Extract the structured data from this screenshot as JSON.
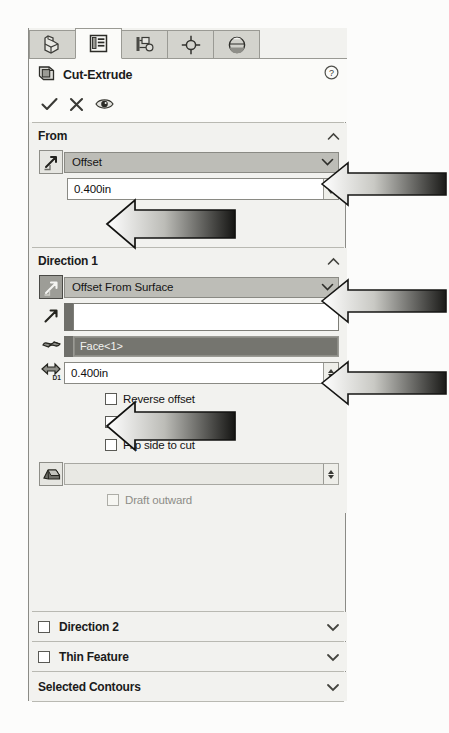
{
  "panel": {
    "title": "Cut-Extrude",
    "title_icon": "cut-extrude-icon",
    "help_icon": "help-circle-icon"
  },
  "tabs": [
    {
      "name": "feature-manager-tab",
      "icon": "solid-part-icon",
      "active": false
    },
    {
      "name": "property-manager-tab",
      "icon": "property-list-icon",
      "active": true
    },
    {
      "name": "configuration-manager-tab",
      "icon": "configuration-icon",
      "active": false
    },
    {
      "name": "dimxpert-manager-tab",
      "icon": "crosshair-target-icon",
      "active": false
    },
    {
      "name": "display-manager-tab",
      "icon": "appearance-sphere-icon",
      "active": false
    }
  ],
  "commands": [
    {
      "name": "ok-button",
      "icon": "checkmark-icon",
      "label": "OK"
    },
    {
      "name": "cancel-button",
      "icon": "x-cross-icon",
      "label": "Cancel"
    },
    {
      "name": "preview-button",
      "icon": "eye-icon",
      "label": "Detailed Preview"
    }
  ],
  "sections": {
    "from": {
      "label": "From",
      "collapse_icon": "chevron-up-icon",
      "start_condition": {
        "icon": "from-start-condition-icon",
        "value": "Offset",
        "dropdown_icon": "chevron-down-icon"
      },
      "offset_distance": {
        "value": "0.400in",
        "spinner_icon": "spinner-updown-icon"
      }
    },
    "direction1": {
      "label": "Direction 1",
      "collapse_icon": "chevron-up-icon",
      "end_condition": {
        "icon": "reverse-direction-icon",
        "value": "Offset From Surface",
        "dropdown_icon": "chevron-down-icon"
      },
      "direction_of_extrusion": {
        "icon": "direction-vector-icon",
        "value": "",
        "placeholder": ""
      },
      "face_plane_reference": {
        "icon": "face-surface-icon",
        "value": "Face<1>"
      },
      "depth": {
        "icon": "depth-d1-icon",
        "label": "D1",
        "value": "0.400in",
        "spinner_icon": "spinner-updown-icon"
      },
      "checkboxes": [
        {
          "name": "reverse-offset-checkbox",
          "label": "Reverse offset",
          "checked": false,
          "enabled": true
        },
        {
          "name": "translate-surface-checkbox",
          "label": "Translate surface",
          "checked": false,
          "enabled": true
        },
        {
          "name": "flip-side-to-cut-checkbox",
          "label": "Flip side to cut",
          "checked": false,
          "enabled": true
        }
      ],
      "draft": {
        "icon": "draft-angle-icon",
        "value": "",
        "enabled": false,
        "spinner_icon": "spinner-updown-icon",
        "outward_checkbox": {
          "label": "Draft outward",
          "checked": false,
          "enabled": false
        }
      }
    },
    "direction2": {
      "label": "Direction 2",
      "checked": false,
      "expand_icon": "chevron-down-icon"
    },
    "thin_feature": {
      "label": "Thin Feature",
      "checked": false,
      "expand_icon": "chevron-down-icon"
    },
    "selected_contours": {
      "label": "Selected Contours",
      "expand_icon": "chevron-down-icon"
    }
  },
  "annotations": {
    "callout_arrows": [
      {
        "name": "annotation-arrow-start-condition",
        "target": "Offset dropdown"
      },
      {
        "name": "annotation-arrow-end-condition",
        "target": "Offset From Surface dropdown"
      },
      {
        "name": "annotation-arrow-face-reference",
        "target": "Face<1>"
      }
    ],
    "inline_arrows": [
      {
        "name": "annotation-arrow-from-offset-value",
        "target": "0.400in from offset"
      },
      {
        "name": "annotation-arrow-depth-value",
        "target": "0.400in depth"
      }
    ]
  },
  "colors": {
    "panel_bg": "#f2f2ef",
    "panel_white": "#fbfbf9",
    "combo_bg": "#bdbdb7",
    "selected_field_bg": "#75756f",
    "border": "#8b8b86",
    "text": "#1b1b1b"
  }
}
